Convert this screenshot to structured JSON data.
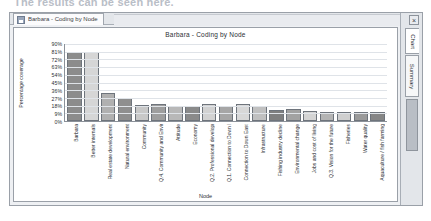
{
  "clipped_header": "The results can be seen here.",
  "window": {
    "tab": {
      "label": "Barbara - Coding by Node",
      "icon": "chart-document-icon"
    },
    "close_label": "×",
    "vertical_tabs": [
      {
        "label": "Chart",
        "active": true
      },
      {
        "label": "Summary",
        "active": false
      }
    ]
  },
  "chart_data": {
    "type": "bar",
    "title": "Barbara - Coding by Node",
    "xlabel": "Node",
    "ylabel": "Percentage coverage",
    "ylim": [
      0,
      90
    ],
    "ytick_labels": [
      "90%",
      "81%",
      "72%",
      "63%",
      "54%",
      "45%",
      "36%",
      "27%",
      "18%",
      "9%",
      "0%"
    ],
    "ytick_values": [
      90,
      81,
      72,
      63,
      54,
      45,
      36,
      27,
      18,
      9,
      0
    ],
    "grid": true,
    "legend": "none",
    "categories": [
      "Barbara",
      "Better internals",
      "Real estate development",
      "Natural environment",
      "Community",
      "Q.4. Community and Environment",
      "Attitude",
      "Economy",
      "Q.2. Professional development",
      "Q.1. Connection to Down East",
      "Connection to Down East",
      "Infrastructure",
      "Fishing industry decline",
      "Environmental change",
      "Jobs and cost of living",
      "Q.3. Vision for the future",
      "Fisheries",
      "Water quality",
      "Aquaculture / fish farming"
    ],
    "values": [
      81,
      81,
      33,
      27,
      19,
      20,
      18,
      17,
      20,
      18,
      20,
      18,
      13,
      14,
      12,
      11,
      11,
      11,
      10
    ],
    "bar_colors": [
      "#8c8c8c",
      "#d6d6d6",
      "#b0b0b0",
      "#8f8f8f",
      "#c8c8c8",
      "#9e9e9e",
      "#b8b8b8",
      "#8a8a8a",
      "#d2d2d2",
      "#a6a6a6",
      "#d8d8d8",
      "#c0c0c0",
      "#7f7f7f",
      "#a2a2a2",
      "#d4d4d4",
      "#b4b4b4",
      "#cfcfcf",
      "#9a9a9a",
      "#868686"
    ]
  }
}
